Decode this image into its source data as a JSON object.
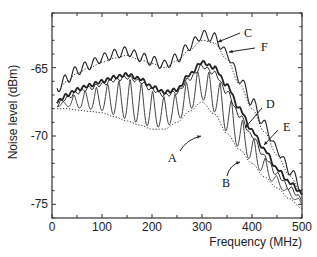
{
  "chart_data": {
    "type": "line",
    "title": "",
    "xlabel": "Frequency (MHz)",
    "ylabel": "Noise level (dBm)",
    "xlim": [
      0,
      500
    ],
    "ylim": [
      -76,
      -61
    ],
    "x_ticks": [
      0,
      100,
      200,
      300,
      400,
      500
    ],
    "y_ticks": [
      -65,
      -70,
      -75
    ],
    "grid": false,
    "legend": "inline labels with arrows",
    "x": [
      10,
      30,
      50,
      75,
      100,
      125,
      150,
      175,
      200,
      225,
      250,
      275,
      300,
      325,
      350,
      375,
      400,
      425,
      450,
      475,
      500
    ],
    "series": [
      {
        "name": "C",
        "style": "solid-thin-wavy",
        "values": [
          -66.5,
          -65.8,
          -65.2,
          -64.8,
          -64.3,
          -64.0,
          -63.8,
          -64.2,
          -64.5,
          -64.8,
          -64.3,
          -63.4,
          -62.6,
          -62.8,
          -64.0,
          -65.8,
          -67.5,
          -69.2,
          -71.0,
          -72.5,
          -73.8
        ]
      },
      {
        "name": "F",
        "style": "dotted",
        "values": [
          -66.7,
          -66.0,
          -65.4,
          -65.0,
          -64.6,
          -64.3,
          -64.1,
          -64.4,
          -64.7,
          -65.0,
          -64.5,
          -63.7,
          -63.0,
          -63.2,
          -64.4,
          -66.2,
          -68.0,
          -69.7,
          -71.4,
          -72.9,
          -74.2
        ]
      },
      {
        "name": "D",
        "style": "solid-thick",
        "values": [
          -67.5,
          -67.0,
          -66.6,
          -66.3,
          -66.0,
          -65.7,
          -65.5,
          -65.8,
          -66.4,
          -66.8,
          -66.6,
          -65.5,
          -64.6,
          -65.0,
          -66.3,
          -68.0,
          -69.6,
          -71.0,
          -72.4,
          -73.4,
          -74.2
        ]
      },
      {
        "name": "E",
        "style": "solid",
        "values": [
          -67.7,
          -67.2,
          -66.8,
          -66.5,
          -66.2,
          -65.9,
          -65.7,
          -66.0,
          -66.6,
          -67.0,
          -66.8,
          -65.8,
          -64.9,
          -65.4,
          -66.8,
          -68.5,
          -70.0,
          -71.5,
          -72.8,
          -73.8,
          -74.6
        ]
      },
      {
        "name": "A",
        "style": "solid-oscillating",
        "values": [
          -67.0,
          -68.0,
          -66.6,
          -68.2,
          -66.0,
          -68.3,
          -65.6,
          -68.7,
          -66.4,
          -69.3,
          -66.6,
          -68.8,
          -64.8,
          -67.8,
          -66.5,
          -69.8,
          -69.7,
          -72.0,
          -72.4,
          -74.5,
          -74.4
        ]
      },
      {
        "name": "B",
        "style": "dotted",
        "values": [
          -68.0,
          -68.0,
          -68.1,
          -68.2,
          -68.3,
          -68.6,
          -68.9,
          -69.2,
          -69.5,
          -69.5,
          -69.0,
          -68.2,
          -67.5,
          -68.4,
          -69.8,
          -71.0,
          -72.0,
          -73.0,
          -73.8,
          -74.6,
          -75.3
        ]
      }
    ],
    "annotations": [
      {
        "label": "A",
        "x": 270,
        "y": -69.8
      },
      {
        "label": "B",
        "x": 360,
        "y": -71.3
      },
      {
        "label": "C",
        "x": 395,
        "y": -61.8
      },
      {
        "label": "D",
        "x": 420,
        "y": -67.4
      },
      {
        "label": "E",
        "x": 455,
        "y": -68.9
      },
      {
        "label": "F",
        "x": 435,
        "y": -63.5
      }
    ]
  },
  "labels": {
    "xlabel": "Frequency (MHz)",
    "ylabel": "Noise level (dBm)",
    "x_ticks": [
      "0",
      "100",
      "200",
      "300",
      "400",
      "500"
    ],
    "y_ticks": [
      "-65",
      "-70",
      "-75"
    ],
    "curves": {
      "A": "A",
      "B": "B",
      "C": "C",
      "D": "D",
      "E": "E",
      "F": "F"
    }
  }
}
